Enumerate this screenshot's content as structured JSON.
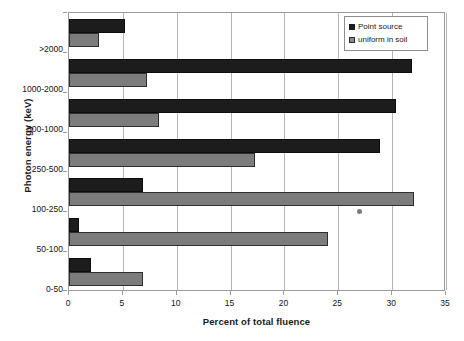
{
  "chart_data": {
    "type": "bar",
    "orientation": "horizontal",
    "title": "",
    "xlabel": "Percent of total fluence",
    "ylabel": "Photon energy (keV)",
    "categories": [
      "0-50",
      "50-100",
      "100-250",
      "250-500",
      "500-1000",
      "1000-2000",
      ">2000"
    ],
    "categories_top_to_bottom": [
      ">2000",
      "1000-2000",
      "500-1000",
      "250-500",
      "100-250",
      "50-100",
      "0-50"
    ],
    "series": [
      {
        "name": "Point source",
        "color": "#1c1c1c",
        "values": [
          2.0,
          0.9,
          6.9,
          28.9,
          30.4,
          31.8,
          5.2
        ],
        "values_top_to_bottom": [
          5.2,
          31.8,
          30.4,
          28.9,
          6.9,
          0.9,
          2.0
        ]
      },
      {
        "name": "uniform in soil",
        "color": "#7c7c7c",
        "values": [
          6.9,
          24.0,
          32.0,
          17.3,
          8.4,
          7.2,
          2.8
        ],
        "values_top_to_bottom": [
          2.8,
          7.2,
          8.4,
          17.3,
          32.0,
          24.0,
          6.9
        ]
      }
    ],
    "xlim": [
      0,
      35
    ],
    "xticks": [
      0,
      5,
      10,
      15,
      20,
      25,
      30,
      35
    ],
    "xtick_labels": [
      "0",
      "5",
      "10",
      "15",
      "20",
      "25",
      "30",
      "35"
    ],
    "grid": "vertical",
    "legend_position": "top-right",
    "annotations": [
      {
        "name": "stray-marker",
        "x": 27.0,
        "category": "100-250",
        "note": "small gray dot artifact below the 100-250 uniform-in-soil bar"
      }
    ]
  },
  "legend": {
    "items": [
      {
        "label": "Point source",
        "swatch": "dark-square-icon"
      },
      {
        "label": "uniform in soil",
        "swatch": "light-square-icon"
      }
    ]
  },
  "axes": {
    "x_title": "Percent of total fluence",
    "y_title": "Photon energy (keV)",
    "x_tick_labels": [
      "0",
      "5",
      "10",
      "15",
      "20",
      "25",
      "30",
      "35"
    ],
    "y_tick_labels": [
      ">2000",
      "1000-2000",
      "500-1000",
      "250-500",
      "100-250",
      "50-100",
      "0-50"
    ]
  }
}
